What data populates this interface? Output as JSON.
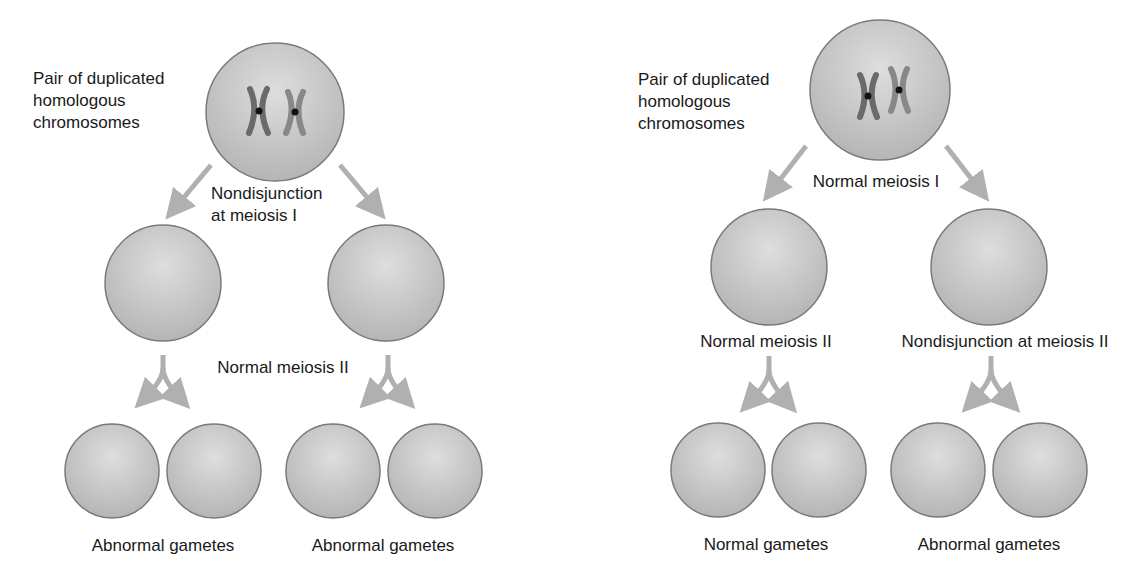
{
  "colors": {
    "cell_fill_light": "#dcdcdc",
    "cell_fill_dark": "#b4b4b4",
    "cell_stroke": "#7a7a7a",
    "arrow": "#b0b0b0",
    "chromosome_dark": "#6e6e6e",
    "chromosome_light": "#8c8c8c",
    "text": "#1a1a1a"
  },
  "left_panel": {
    "parent_label": "Pair of duplicated\nhomologous\nchromosomes",
    "meiosis1_label": "Nondisjunction\nat meiosis I",
    "meiosis2_label": "Normal meiosis II",
    "gametes_left_label": "Abnormal gametes",
    "gametes_right_label": "Abnormal gametes"
  },
  "right_panel": {
    "parent_label": "Pair of duplicated\nhomologous\nchromosomes",
    "meiosis1_label": "Normal meiosis I",
    "meiosis2_left_label": "Normal meiosis II",
    "meiosis2_right_label": "Nondisjunction at meiosis II",
    "gametes_left_label": "Normal gametes",
    "gametes_right_label": "Abnormal gametes"
  }
}
